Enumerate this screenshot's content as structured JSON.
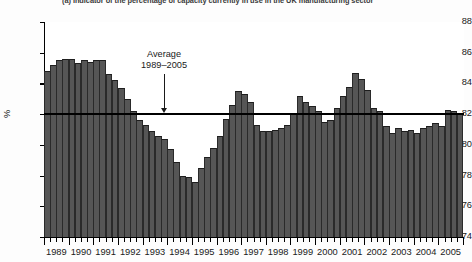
{
  "caption": {
    "text": "(a)  Indicator of the percentage of capacity currently in use in the UK manufacturing sector"
  },
  "axes": {
    "ylabel": "%",
    "yticks": [
      88,
      86,
      84,
      82,
      80,
      78,
      76,
      74
    ],
    "ylim": [
      74,
      88
    ],
    "xticks": [
      "1989",
      "1990",
      "1991",
      "1992",
      "1993",
      "1994",
      "1995",
      "1996",
      "1997",
      "1998",
      "1999",
      "2000",
      "2001",
      "2002",
      "2003",
      "2004",
      "2005"
    ]
  },
  "annotation": {
    "line1": "Average",
    "line2": "1989–2005",
    "value": 82.0
  },
  "colors": {
    "bar": "#565656",
    "bar_edge": "#2a2a2a",
    "axis": "#000000",
    "average_line": "#000000",
    "plot_background": "#ffffff"
  },
  "chart_data": {
    "type": "bar",
    "title": "(a)  Indicator of the percentage of capacity currently in use in the UK manufacturing sector",
    "xlabel": "",
    "ylabel": "%",
    "ylim": [
      74,
      88
    ],
    "xlim": [
      "1989 Q1",
      "2005 Q4"
    ],
    "grid": false,
    "legend": null,
    "frequency": "quarterly",
    "average_line": {
      "label": "Average 1989–2005",
      "value": 82.0
    },
    "categories": [
      "1989 Q1",
      "1989 Q2",
      "1989 Q3",
      "1989 Q4",
      "1990 Q1",
      "1990 Q2",
      "1990 Q3",
      "1990 Q4",
      "1991 Q1",
      "1991 Q2",
      "1991 Q3",
      "1991 Q4",
      "1992 Q1",
      "1992 Q2",
      "1992 Q3",
      "1992 Q4",
      "1993 Q1",
      "1993 Q2",
      "1993 Q3",
      "1993 Q4",
      "1994 Q1",
      "1994 Q2",
      "1994 Q3",
      "1994 Q4",
      "1995 Q1",
      "1995 Q2",
      "1995 Q3",
      "1995 Q4",
      "1996 Q1",
      "1996 Q2",
      "1996 Q3",
      "1996 Q4",
      "1997 Q1",
      "1997 Q2",
      "1997 Q3",
      "1997 Q4",
      "1998 Q1",
      "1998 Q2",
      "1998 Q3",
      "1998 Q4",
      "1999 Q1",
      "1999 Q2",
      "1999 Q3",
      "1999 Q4",
      "2000 Q1",
      "2000 Q2",
      "2000 Q3",
      "2000 Q4",
      "2001 Q1",
      "2001 Q2",
      "2001 Q3",
      "2001 Q4",
      "2002 Q1",
      "2002 Q2",
      "2002 Q3",
      "2002 Q4",
      "2003 Q1",
      "2003 Q2",
      "2003 Q3",
      "2003 Q4",
      "2004 Q1",
      "2004 Q2",
      "2004 Q3",
      "2004 Q4",
      "2005 Q1",
      "2005 Q2",
      "2005 Q3",
      "2005 Q4"
    ],
    "values": [
      84.8,
      85.2,
      85.5,
      85.6,
      85.6,
      85.3,
      85.5,
      85.4,
      85.5,
      85.5,
      84.6,
      84.2,
      83.7,
      83.0,
      82.2,
      81.6,
      81.3,
      80.9,
      80.6,
      80.4,
      79.7,
      78.9,
      78.0,
      77.9,
      77.6,
      78.5,
      79.2,
      79.8,
      80.6,
      81.7,
      82.6,
      83.5,
      83.3,
      82.8,
      81.3,
      80.9,
      80.9,
      81.0,
      81.1,
      81.3,
      82.1,
      83.2,
      82.8,
      82.5,
      82.2,
      81.5,
      81.6,
      82.4,
      83.2,
      83.8,
      84.7,
      84.3,
      83.6,
      82.4,
      82.2,
      81.2,
      80.8,
      81.1,
      80.9,
      81.0,
      80.8,
      81.1,
      81.2,
      81.4,
      81.2,
      82.3,
      82.2,
      82.1
    ]
  }
}
